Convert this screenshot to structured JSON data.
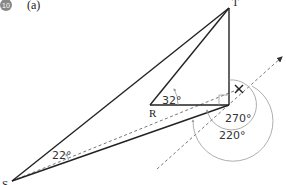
{
  "header": {
    "question_number": "10",
    "part": "(a)"
  },
  "points": {
    "T": {
      "label": "T"
    },
    "R": {
      "label": "R"
    },
    "S": {
      "label": "S"
    },
    "X": {
      "label": "×"
    }
  },
  "angles": {
    "at_S": "22°",
    "at_R": "32°",
    "reflex_1": "270°",
    "reflex_2": "220°"
  },
  "colors": {
    "line": "#222222",
    "dashed": "#777777",
    "arc": "#999999",
    "badge": "#888888"
  }
}
